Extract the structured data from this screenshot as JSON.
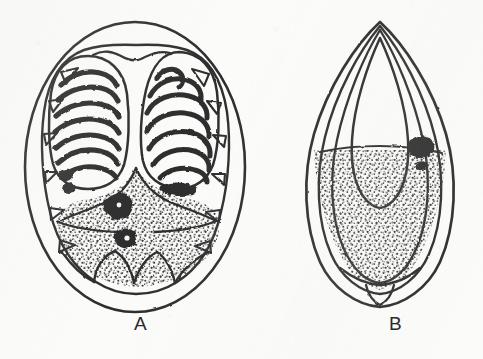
{
  "figure": {
    "background_color": "#fbfbfa",
    "ink_color": "#1d1d1d",
    "stipple_color": "#333333",
    "width": 483,
    "height": 359,
    "panels": [
      {
        "id": "A",
        "label": "A",
        "label_x": 140,
        "label_y": 322,
        "view": "dorsal-oval-view",
        "description": "Broad oval body outline with inner rim bearing triangular marginal spines; two large ovoid lobes in the upper half each filled with transverse arched ribs; lower half a stippled granular field containing two dark irregular masses; base bordered by scalloped arches.",
        "outline": {
          "cx": 135,
          "cy": 167,
          "rx": 110,
          "ry": 145
        },
        "inner_rim": {
          "cx": 135,
          "cy": 170,
          "rx": 93,
          "ry": 127
        },
        "lobes": [
          {
            "name": "left-lobe",
            "cx": 88,
            "cy": 118,
            "rx": 38,
            "ry": 62,
            "rib_count": 7
          },
          {
            "name": "right-lobe",
            "cx": 180,
            "cy": 115,
            "rx": 38,
            "ry": 63,
            "rib_count": 7
          }
        ],
        "dark_masses": [
          {
            "name": "upper-dark-mass",
            "cx": 118,
            "cy": 205,
            "r": 12
          },
          {
            "name": "lower-dark-mass",
            "cx": 126,
            "cy": 238,
            "r": 9
          },
          {
            "name": "lateral-dark-patch",
            "cx": 178,
            "cy": 190,
            "r": 11
          }
        ],
        "marginal_spine_count": 12,
        "basal_scallop_count": 4
      },
      {
        "id": "B",
        "label": "B",
        "label_x": 395,
        "label_y": 322,
        "view": "lateral-lens-view",
        "description": "Pointed almond or lens-shaped lateral profile with three nested outlines converging at apex and base; a vertical median line runs the full height; an inner teardrop sac occupies the upper two thirds; lower two thirds filled with stippled granular texture and one dark irregular mass at mid-right.",
        "apex": {
          "x": 380,
          "y": 22
        },
        "base": {
          "x": 380,
          "y": 307
        },
        "half_width": 72,
        "median_line_x": 380,
        "nested_outline_count": 3,
        "dark_masses": [
          {
            "name": "lateral-dark-mass",
            "cx": 422,
            "cy": 148,
            "r": 10
          }
        ]
      }
    ]
  },
  "labels": {
    "panel_a": "A",
    "panel_b": "B"
  }
}
